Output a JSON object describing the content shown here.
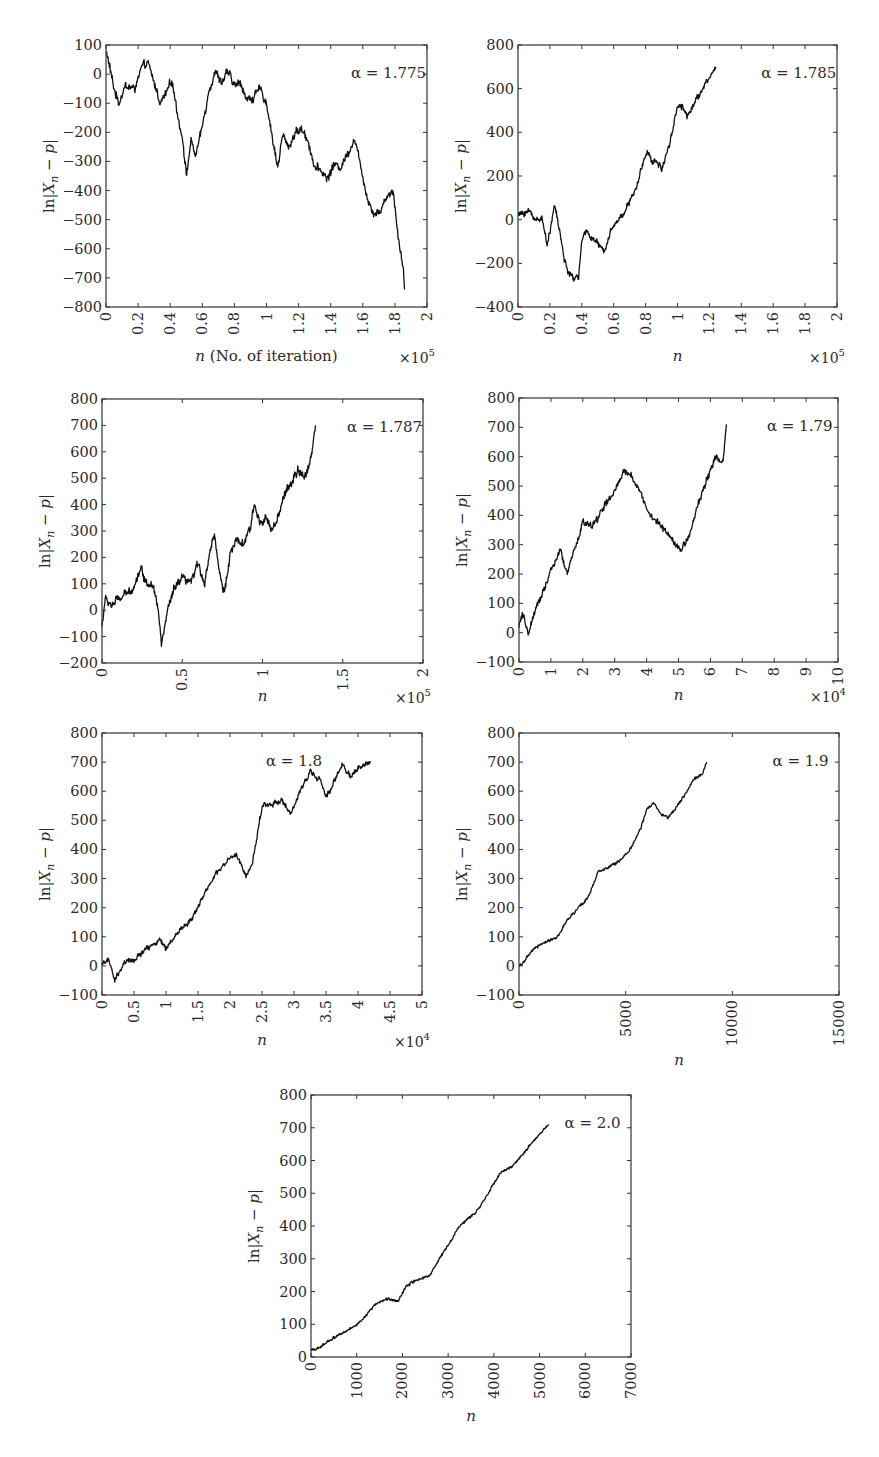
{
  "figure": {
    "panels_count": 7,
    "common_ylabel": "ln|X_n − p|",
    "line_color": "#111111",
    "frame_color": "#333333"
  },
  "chart_data": [
    {
      "type": "line",
      "title": "",
      "annotation": "α = 1.775",
      "xlabel": "n (No. of iteration)",
      "xlabel_italic_part": "n",
      "xlabel_rest": " (No. of iteration)",
      "ylabel": "ln|X_n − p|",
      "x_multiplier": "×10^5",
      "xlim": [
        0,
        2
      ],
      "ylim": [
        -800,
        100
      ],
      "xticks": [
        0,
        0.2,
        0.4,
        0.6,
        0.8,
        1,
        1.2,
        1.4,
        1.6,
        1.8,
        2
      ],
      "xtick_labels": [
        "0",
        "0.2",
        "0.4",
        "0.6",
        "0.8",
        "1",
        "1.2",
        "1.4",
        "1.6",
        "1.8",
        "2"
      ],
      "yticks": [
        -800,
        -700,
        -600,
        -500,
        -400,
        -300,
        -200,
        -100,
        0,
        100
      ],
      "ytick_labels": [
        "−800",
        "−700",
        "−600",
        "−500",
        "−400",
        "−300",
        "−200",
        "−100",
        "0",
        "100"
      ],
      "grid": false,
      "legend": "none",
      "noise": 14,
      "series": [
        {
          "name": "α = 1.775",
          "x": [
            0,
            0.01,
            0.05,
            0.08,
            0.12,
            0.18,
            0.22,
            0.26,
            0.3,
            0.34,
            0.37,
            0.41,
            0.45,
            0.48,
            0.5,
            0.53,
            0.56,
            0.6,
            0.64,
            0.68,
            0.72,
            0.76,
            0.8,
            0.84,
            0.88,
            0.92,
            0.96,
            1.0,
            1.04,
            1.07,
            1.1,
            1.14,
            1.18,
            1.22,
            1.26,
            1.3,
            1.34,
            1.38,
            1.42,
            1.46,
            1.5,
            1.55,
            1.6,
            1.63,
            1.67,
            1.71,
            1.75,
            1.79,
            1.82,
            1.85,
            1.86
          ],
          "y": [
            80,
            60,
            -50,
            -100,
            -40,
            -50,
            20,
            40,
            -30,
            -100,
            -70,
            -20,
            -150,
            -230,
            -350,
            -230,
            -280,
            -180,
            -60,
            10,
            -30,
            10,
            -40,
            -30,
            -90,
            -80,
            -50,
            -100,
            -230,
            -320,
            -210,
            -250,
            -200,
            -190,
            -230,
            -320,
            -330,
            -360,
            -310,
            -320,
            -280,
            -220,
            -350,
            -430,
            -480,
            -470,
            -420,
            -400,
            -560,
            -650,
            -740
          ]
        }
      ]
    },
    {
      "type": "line",
      "title": "",
      "annotation": "α = 1.785",
      "xlabel": "n",
      "xlabel_italic_part": "n",
      "xlabel_rest": "",
      "ylabel": "ln|X_n − p|",
      "x_multiplier": "×10^5",
      "xlim": [
        0,
        2
      ],
      "ylim": [
        -400,
        800
      ],
      "xticks": [
        0,
        0.2,
        0.4,
        0.6,
        0.8,
        1,
        1.2,
        1.4,
        1.6,
        1.8,
        2
      ],
      "xtick_labels": [
        "0",
        "0.2",
        "0.4",
        "0.6",
        "0.8",
        "1",
        "1.2",
        "1.4",
        "1.6",
        "1.8",
        "2"
      ],
      "yticks": [
        -400,
        -200,
        0,
        200,
        400,
        600,
        800
      ],
      "ytick_labels": [
        "−400",
        "−200",
        "0",
        "200",
        "400",
        "600",
        "800"
      ],
      "grid": false,
      "legend": "none",
      "noise": 14,
      "series": [
        {
          "name": "α = 1.785",
          "x": [
            0,
            0.03,
            0.07,
            0.11,
            0.15,
            0.18,
            0.21,
            0.23,
            0.26,
            0.29,
            0.32,
            0.35,
            0.38,
            0.4,
            0.43,
            0.46,
            0.5,
            0.54,
            0.58,
            0.62,
            0.66,
            0.7,
            0.74,
            0.78,
            0.81,
            0.84,
            0.87,
            0.9,
            0.93,
            0.96,
            1.0,
            1.03,
            1.06,
            1.09,
            1.12,
            1.16,
            1.2,
            1.24
          ],
          "y": [
            20,
            30,
            40,
            0,
            10,
            -110,
            -20,
            70,
            -50,
            -180,
            -250,
            -270,
            -260,
            -100,
            -50,
            -80,
            -110,
            -150,
            -50,
            -10,
            30,
            80,
            140,
            250,
            320,
            260,
            270,
            230,
            300,
            380,
            520,
            520,
            470,
            520,
            550,
            600,
            650,
            700
          ]
        }
      ]
    },
    {
      "type": "line",
      "title": "",
      "annotation": "α = 1.787",
      "xlabel": "n",
      "xlabel_italic_part": "n",
      "xlabel_rest": "",
      "ylabel": "ln|X_n − p|",
      "x_multiplier": "×10^5",
      "xlim": [
        0,
        2
      ],
      "ylim": [
        -200,
        800
      ],
      "xticks": [
        0,
        0.5,
        1,
        1.5,
        2
      ],
      "xtick_labels": [
        "0",
        "0.5",
        "1",
        "1.5",
        "2"
      ],
      "yticks": [
        -200,
        -100,
        0,
        100,
        200,
        300,
        400,
        500,
        600,
        700,
        800
      ],
      "ytick_labels": [
        "−200",
        "−100",
        "0",
        "100",
        "200",
        "300",
        "400",
        "500",
        "600",
        "700",
        "800"
      ],
      "grid": false,
      "legend": "none",
      "noise": 16,
      "series": [
        {
          "name": "α = 1.787",
          "x": [
            0,
            0.02,
            0.06,
            0.1,
            0.15,
            0.2,
            0.24,
            0.28,
            0.32,
            0.35,
            0.37,
            0.41,
            0.45,
            0.5,
            0.55,
            0.6,
            0.64,
            0.68,
            0.7,
            0.73,
            0.76,
            0.8,
            0.84,
            0.88,
            0.92,
            0.95,
            0.98,
            1.02,
            1.06,
            1.1,
            1.14,
            1.18,
            1.22,
            1.26,
            1.3,
            1.33
          ],
          "y": [
            -60,
            40,
            20,
            40,
            60,
            90,
            160,
            100,
            100,
            0,
            -130,
            0,
            80,
            120,
            100,
            180,
            100,
            250,
            290,
            150,
            60,
            220,
            260,
            250,
            300,
            400,
            340,
            350,
            300,
            350,
            450,
            480,
            530,
            500,
            570,
            700
          ]
        }
      ]
    },
    {
      "type": "line",
      "title": "",
      "annotation": "α = 1.79",
      "xlabel": "n",
      "xlabel_italic_part": "n",
      "xlabel_rest": "",
      "ylabel": "ln|X_n − p|",
      "x_multiplier": "×10^4",
      "xlim": [
        0,
        10
      ],
      "ylim": [
        -100,
        800
      ],
      "xticks": [
        0,
        1,
        2,
        3,
        4,
        5,
        6,
        7,
        8,
        9,
        10
      ],
      "xtick_labels": [
        "0",
        "1",
        "2",
        "3",
        "4",
        "5",
        "6",
        "7",
        "8",
        "9",
        "10"
      ],
      "yticks": [
        -100,
        0,
        100,
        200,
        300,
        400,
        500,
        600,
        700,
        800
      ],
      "ytick_labels": [
        "−100",
        "0",
        "100",
        "200",
        "300",
        "400",
        "500",
        "600",
        "700",
        "800"
      ],
      "grid": false,
      "legend": "none",
      "noise": 12,
      "series": [
        {
          "name": "α = 1.79",
          "x": [
            0,
            0.1,
            0.3,
            0.6,
            1.0,
            1.3,
            1.5,
            1.8,
            2.0,
            2.3,
            2.6,
            3.0,
            3.3,
            3.5,
            3.8,
            4.1,
            4.5,
            4.8,
            5.1,
            5.3,
            5.6,
            5.9,
            6.2,
            6.4,
            6.5
          ],
          "y": [
            20,
            60,
            0,
            100,
            210,
            280,
            200,
            300,
            380,
            360,
            420,
            480,
            550,
            540,
            480,
            400,
            360,
            320,
            280,
            320,
            430,
            530,
            600,
            580,
            710
          ]
        }
      ]
    },
    {
      "type": "line",
      "title": "",
      "annotation": "α = 1.8",
      "xlabel": "n",
      "xlabel_italic_part": "n",
      "xlabel_rest": "",
      "ylabel": "ln|X_n − p|",
      "x_multiplier": "×10^4",
      "xlim": [
        0,
        5
      ],
      "ylim": [
        -100,
        800
      ],
      "xticks": [
        0,
        0.5,
        1,
        1.5,
        2,
        2.5,
        3,
        3.5,
        4,
        4.5,
        5
      ],
      "xtick_labels": [
        "0",
        "0.5",
        "1",
        "1.5",
        "2",
        "2.5",
        "3",
        "3.5",
        "4",
        "4.5",
        "5"
      ],
      "yticks": [
        -100,
        0,
        100,
        200,
        300,
        400,
        500,
        600,
        700,
        800
      ],
      "ytick_labels": [
        "−100",
        "0",
        "100",
        "200",
        "300",
        "400",
        "500",
        "600",
        "700",
        "800"
      ],
      "grid": false,
      "legend": "none",
      "noise": 9,
      "series": [
        {
          "name": "α = 1.8",
          "x": [
            0,
            0.1,
            0.2,
            0.35,
            0.5,
            0.7,
            0.9,
            1.0,
            1.2,
            1.4,
            1.6,
            1.8,
            2.0,
            2.1,
            2.25,
            2.35,
            2.5,
            2.7,
            2.8,
            2.95,
            3.1,
            3.25,
            3.4,
            3.5,
            3.6,
            3.75,
            3.9,
            4.0,
            4.2
          ],
          "y": [
            10,
            20,
            -50,
            10,
            20,
            60,
            90,
            60,
            120,
            160,
            250,
            320,
            370,
            380,
            310,
            350,
            550,
            560,
            570,
            520,
            600,
            670,
            640,
            580,
            620,
            690,
            650,
            680,
            700
          ]
        }
      ]
    },
    {
      "type": "line",
      "title": "",
      "annotation": "α = 1.9",
      "xlabel": "n",
      "xlabel_italic_part": "n",
      "xlabel_rest": "",
      "ylabel": "ln|X_n − p|",
      "x_multiplier": "",
      "xlim": [
        0,
        15000
      ],
      "ylim": [
        -100,
        800
      ],
      "xticks": [
        0,
        5000,
        10000,
        15000
      ],
      "xtick_labels": [
        "0",
        "5000",
        "10000",
        "15000"
      ],
      "yticks": [
        -100,
        0,
        100,
        200,
        300,
        400,
        500,
        600,
        700,
        800
      ],
      "ytick_labels": [
        "−100",
        "0",
        "100",
        "200",
        "300",
        "400",
        "500",
        "600",
        "700",
        "800"
      ],
      "grid": false,
      "legend": "none",
      "noise": 5,
      "series": [
        {
          "name": "α = 1.9",
          "x": [
            0,
            300,
            700,
            1200,
            1800,
            2300,
            2800,
            3200,
            3700,
            4200,
            4700,
            5200,
            5700,
            6000,
            6300,
            6700,
            7000,
            7400,
            7800,
            8200,
            8600,
            8800
          ],
          "y": [
            0,
            20,
            60,
            80,
            100,
            160,
            200,
            230,
            320,
            340,
            360,
            400,
            470,
            540,
            560,
            520,
            510,
            550,
            590,
            640,
            660,
            700
          ]
        }
      ]
    },
    {
      "type": "line",
      "title": "",
      "annotation": "α = 2.0",
      "xlabel": "n",
      "xlabel_italic_part": "n",
      "xlabel_rest": "",
      "ylabel": "ln|X_n − p|",
      "x_multiplier": "",
      "xlim": [
        0,
        7000
      ],
      "ylim": [
        0,
        800
      ],
      "xticks": [
        0,
        1000,
        2000,
        3000,
        4000,
        5000,
        6000,
        7000
      ],
      "xtick_labels": [
        "0",
        "1000",
        "2000",
        "3000",
        "4000",
        "5000",
        "6000",
        "7000"
      ],
      "yticks": [
        0,
        100,
        200,
        300,
        400,
        500,
        600,
        700,
        800
      ],
      "ytick_labels": [
        "0",
        "100",
        "200",
        "300",
        "400",
        "500",
        "600",
        "700",
        "800"
      ],
      "grid": false,
      "legend": "none",
      "noise": 4,
      "series": [
        {
          "name": "α = 2.0",
          "x": [
            0,
            200,
            500,
            800,
            1100,
            1400,
            1700,
            1900,
            2100,
            2400,
            2600,
            2800,
            3000,
            3200,
            3400,
            3600,
            3800,
            4000,
            4200,
            4400,
            4700,
            5000,
            5200
          ],
          "y": [
            20,
            30,
            60,
            80,
            110,
            160,
            180,
            170,
            220,
            240,
            250,
            300,
            340,
            390,
            420,
            440,
            480,
            530,
            570,
            580,
            630,
            680,
            710
          ]
        }
      ]
    }
  ]
}
